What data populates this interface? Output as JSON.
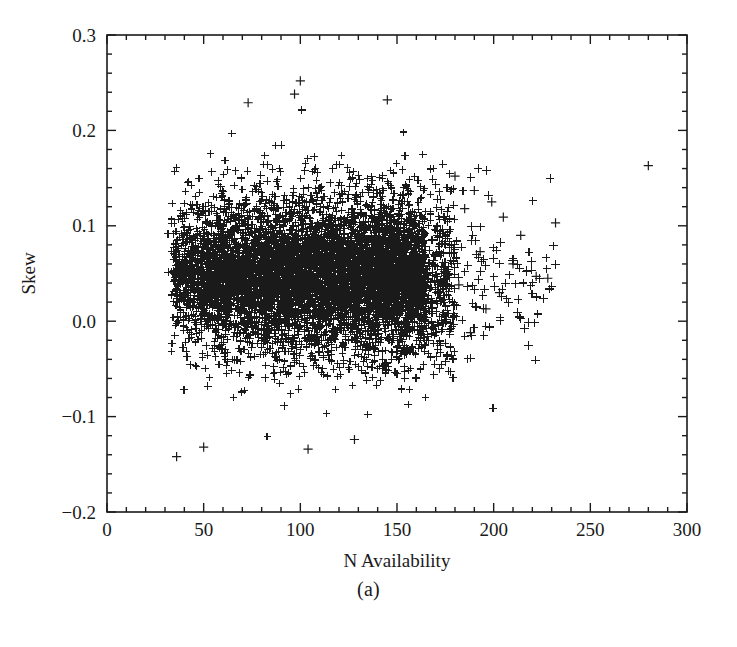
{
  "figure": {
    "caption": "(a)"
  },
  "chart_data": {
    "type": "scatter",
    "title": "",
    "xlabel": "N Availability",
    "ylabel": "Skew",
    "xlim": [
      0,
      300
    ],
    "ylim": [
      -0.2,
      0.3
    ],
    "x_ticks": [
      0,
      50,
      100,
      150,
      200,
      250,
      300
    ],
    "x_tick_labels": [
      "0",
      "50",
      "100",
      "150",
      "200",
      "250",
      "300"
    ],
    "y_ticks": [
      -0.2,
      -0.1,
      0.0,
      0.1,
      0.2,
      0.3
    ],
    "y_tick_labels": [
      "-0.2",
      "-0.1",
      "0.0",
      "0.1",
      "0.2",
      "0.3"
    ],
    "x_minor_step": 10,
    "y_minor_step": 0.02,
    "grid": false,
    "legend": null,
    "marker": "plus",
    "marker_color": "#1a1a1a",
    "point_count_approx": 5200,
    "distribution": {
      "x_cutoff_min": 30,
      "x_core_max": 172,
      "x_tail_max": 232,
      "y_center": 0.048,
      "y_spread": 0.045,
      "y_observed_min": -0.145,
      "y_observed_max": 0.252,
      "description": "Dense vertical band of plus markers with a sharp left edge at N=30, near-saturated core between N=35 and N=165 centred on Skew=0.05, density decaying toward larger N with a sparse tail out to N=232."
    },
    "notable_points": [
      {
        "x": 280,
        "y": 0.163
      },
      {
        "x": 232,
        "y": 0.103
      },
      {
        "x": 228,
        "y": 0.045
      },
      {
        "x": 222,
        "y": 0.047
      },
      {
        "x": 214,
        "y": 0.09
      },
      {
        "x": 210,
        "y": 0.06
      },
      {
        "x": 205,
        "y": 0.109
      },
      {
        "x": 203,
        "y": 0.03
      },
      {
        "x": 199,
        "y": 0.125
      },
      {
        "x": 196,
        "y": 0.013
      },
      {
        "x": 193,
        "y": 0.073
      },
      {
        "x": 190,
        "y": 0.137
      },
      {
        "x": 188,
        "y": -0.012
      },
      {
        "x": 185,
        "y": 0.118
      },
      {
        "x": 182,
        "y": 0.038
      },
      {
        "x": 180,
        "y": 0.152
      },
      {
        "x": 100,
        "y": 0.252
      },
      {
        "x": 97,
        "y": 0.238
      },
      {
        "x": 73,
        "y": 0.229
      },
      {
        "x": 145,
        "y": 0.232
      },
      {
        "x": 36,
        "y": -0.142
      },
      {
        "x": 50,
        "y": -0.132
      },
      {
        "x": 104,
        "y": -0.134
      },
      {
        "x": 128,
        "y": -0.124
      }
    ]
  }
}
